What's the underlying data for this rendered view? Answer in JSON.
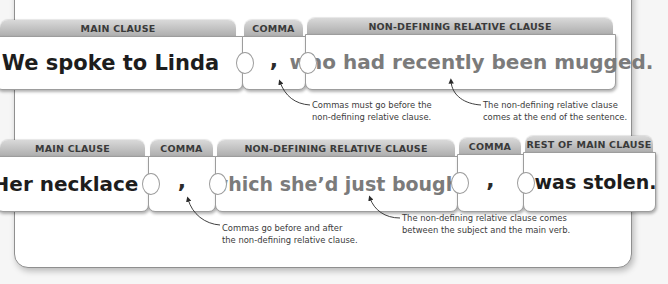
{
  "examples": [
    {
      "pieces": [
        {
          "tab": "MAIN CLAUSE",
          "text": "We spoke to Linda",
          "style": "dark"
        },
        {
          "tab": "COMMA",
          "text": ",",
          "style": "comma"
        },
        {
          "tab": "NON-DEFINING RELATIVE CLAUSE",
          "text": "who had recently been mugged.",
          "style": "grey"
        }
      ],
      "notes": [
        {
          "line1": "Commas must go before the",
          "line2": "non-defining relative clause."
        },
        {
          "line1": "The non-defining relative clause",
          "line2": "comes at the end of the sentence."
        }
      ]
    },
    {
      "pieces": [
        {
          "tab": "MAIN CLAUSE",
          "text": "Her necklace",
          "style": "dark"
        },
        {
          "tab": "COMMA",
          "text": ",",
          "style": "comma"
        },
        {
          "tab": "NON-DEFINING RELATIVE CLAUSE",
          "text": "which she’d just bought",
          "style": "grey"
        },
        {
          "tab": "COMMA",
          "text": ",",
          "style": "comma"
        },
        {
          "tab": "REST OF MAIN CLAUSE",
          "text": "was stolen.",
          "style": "dark"
        }
      ],
      "notes": [
        {
          "line1": "Commas go before and after",
          "line2": "the non-defining relative clause."
        },
        {
          "line1": "The non-defining relative clause comes",
          "line2": "between the subject and the main verb."
        }
      ]
    }
  ],
  "colors": {
    "tab_gradient_top": "#d9d9d9",
    "tab_gradient_bottom": "#a9a9a9",
    "main_clause_text": "#1d1d1d",
    "relative_clause_text": "#7b7b7b",
    "panel_border": "#8f8f8f"
  }
}
